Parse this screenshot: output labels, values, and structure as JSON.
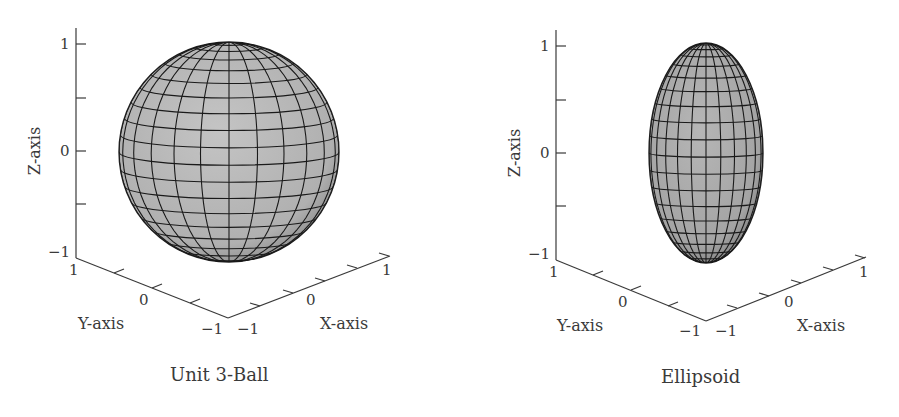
{
  "chart_data": [
    {
      "type": "surface3d",
      "title": "Unit 3-Ball",
      "xlabel": "X-axis",
      "ylabel": "Y-axis",
      "zlabel": "Z-axis",
      "xlim": [
        -1,
        1
      ],
      "ylim": [
        -1,
        1
      ],
      "zlim": [
        -1,
        1
      ],
      "x_ticks": [
        "-1",
        "0",
        "1"
      ],
      "y_ticks": [
        "1",
        "0",
        "-1"
      ],
      "z_ticks": [
        "1",
        "0",
        "-1"
      ],
      "surface": {
        "shape": "sphere",
        "radii": [
          1,
          1,
          1
        ],
        "center": [
          0,
          0,
          0
        ],
        "mesh": "latitude-longitude grid",
        "face_color": "#b4b4b4",
        "edge_color": "#1a1a1a"
      },
      "grid": false
    },
    {
      "type": "surface3d",
      "title": "Ellipsoid",
      "xlabel": "X-axis",
      "ylabel": "Y-axis",
      "zlabel": "Z-axis",
      "xlim": [
        -1,
        1
      ],
      "ylim": [
        -1,
        1
      ],
      "zlim": [
        -1,
        1
      ],
      "x_ticks": [
        "-1",
        "0",
        "1"
      ],
      "y_ticks": [
        "1",
        "0",
        "-1"
      ],
      "z_ticks": [
        "1",
        "0",
        "-1"
      ],
      "surface": {
        "shape": "ellipsoid",
        "radii": [
          0.5,
          0.5,
          1
        ],
        "center": [
          0,
          0,
          0
        ],
        "mesh": "latitude-longitude grid",
        "face_color": "#a9a9a9",
        "edge_color": "#1a1a1a"
      },
      "grid": false
    }
  ],
  "plots": [
    {
      "title": "Unit 3-Ball",
      "xlabel": "X-axis",
      "ylabel": "Y-axis",
      "zlabel": "Z-axis",
      "z_ticks": {
        "top": "1",
        "mid": "0",
        "bottom": "−1"
      },
      "y_ticks": {
        "near": "1",
        "mid": "0",
        "far": "−1"
      },
      "x_ticks": {
        "near": "−1",
        "mid": "0",
        "far": "1"
      }
    },
    {
      "title": "Ellipsoid",
      "xlabel": "X-axis",
      "ylabel": "Y-axis",
      "zlabel": "Z-axis",
      "z_ticks": {
        "top": "1",
        "mid": "0",
        "bottom": "−1"
      },
      "y_ticks": {
        "near": "1",
        "mid": "0",
        "far": "−1"
      },
      "x_ticks": {
        "near": "−1",
        "mid": "0",
        "far": "1"
      }
    }
  ],
  "colors": {
    "axis": "#3a3a3a",
    "surface_sphere": "#b4b4b4",
    "surface_ellipsoid": "#a9a9a9",
    "mesh": "#1a1a1a"
  }
}
